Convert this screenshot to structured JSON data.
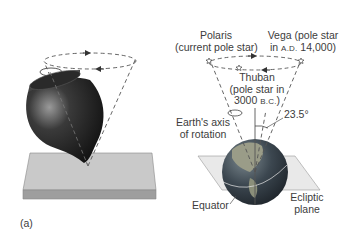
{
  "panel_label": "(a)",
  "labels": {
    "polaris_line1": "Polaris",
    "polaris_line2": "(current pole star)",
    "vega_line1": "Vega (pole star",
    "vega_line2_prefix": "in ",
    "vega_era": "A.D.",
    "vega_year": " 14,000)",
    "thuban_line1": "Thuban",
    "thuban_line2": "(pole star in",
    "thuban_line3_year": "3000 ",
    "thuban_era": "B.C.",
    "thuban_close": ")",
    "tilt_angle": "23.5°",
    "axis_line1": "Earth's axis",
    "axis_line2": "of rotation",
    "equator": "Equator",
    "ecliptic_line1": "Ecliptic",
    "ecliptic_line2": "plane"
  },
  "colors": {
    "top_dark": "#2a2a2a",
    "top_highlight": "#8a8a8a",
    "platform_top": "#c9c9c9",
    "platform_side": "#9e9e9e",
    "ocean": "#3d4a55",
    "land": "#8b8f7a",
    "ecliptic_plane": "#d8d8d8",
    "line": "#444444"
  }
}
